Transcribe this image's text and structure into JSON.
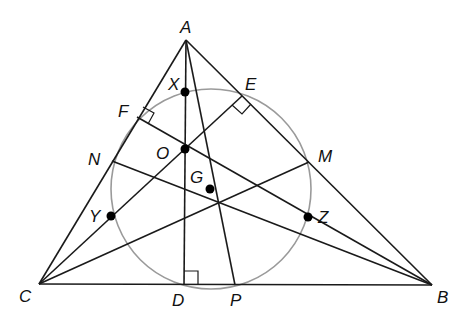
{
  "labels": {
    "A": "A",
    "B": "B",
    "C": "C",
    "D": "D",
    "E": "E",
    "F": "F",
    "M": "M",
    "N": "N",
    "P": "P",
    "O": "O",
    "G": "G",
    "X": "X",
    "Y": "Y",
    "Z": "Z"
  },
  "points": {
    "A": [
      186,
      40
    ],
    "B": [
      432,
      285
    ],
    "C": [
      39,
      284
    ],
    "D": [
      184,
      285
    ],
    "E": [
      242,
      96
    ],
    "F": [
      137,
      117
    ],
    "M": [
      309,
      162
    ],
    "N": [
      112,
      161
    ],
    "P": [
      235,
      285
    ],
    "O": [
      185,
      149
    ],
    "G": [
      210,
      189
    ],
    "Centroid": [
      219,
      203
    ],
    "X": [
      185,
      92
    ],
    "Y": [
      111,
      216
    ],
    "Z": [
      308,
      217
    ]
  },
  "circle": {
    "cx": 211,
    "cy": 189,
    "r": 100,
    "color": "#9a9a9a"
  },
  "line_color": "#1a1a1a"
}
